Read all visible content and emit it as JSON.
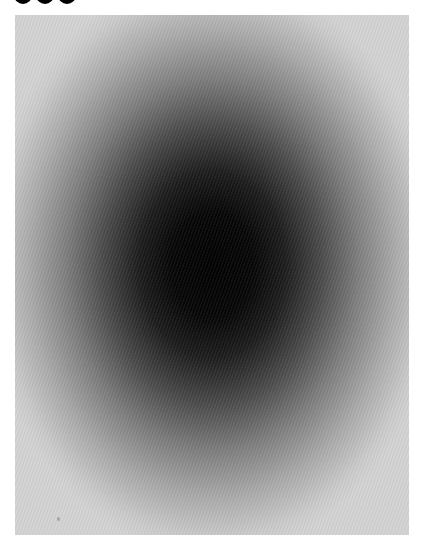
{
  "caption": {
    "partial_glyphs": 3,
    "color": "#000000"
  },
  "artwork": {
    "description": "Vertical elliptical radial gradient, black center fading to light gray edges",
    "center_color": "#000000",
    "edge_color": "#d2d2d2",
    "background_color": "#ffffff"
  }
}
